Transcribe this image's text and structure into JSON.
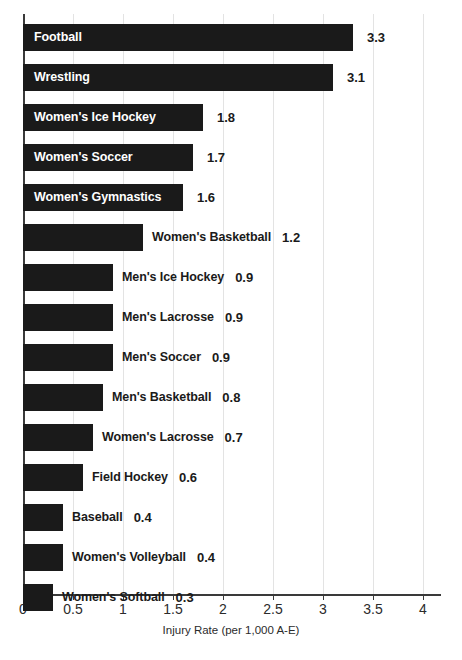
{
  "chart_data": {
    "type": "bar",
    "orientation": "horizontal",
    "title": "",
    "xlabel": "Injury Rate (per 1,000 A-E)",
    "ylabel": "",
    "xlim": [
      0,
      4.2
    ],
    "xticks": [
      "0",
      "0.5",
      "1",
      "1.5",
      "2",
      "2.5",
      "3",
      "3.5",
      "4"
    ],
    "xtick_values": [
      0,
      0.5,
      1,
      1.5,
      2,
      2.5,
      3,
      3.5,
      4
    ],
    "grid": true,
    "grid_axis": "x",
    "legend": "none",
    "bar_color": "#1a1a1a",
    "categories": [
      "Football",
      "Wrestling",
      "Women's Ice Hockey",
      "Women's Soccer",
      "Women's Gymnastics",
      "Women's Basketball",
      "Men's Ice Hockey",
      "Men's Lacrosse",
      "Men's Soccer",
      "Men's Basketball",
      "Women's Lacrosse",
      "Field Hockey",
      "Baseball",
      "Women's Volleyball",
      "Women's Softball"
    ],
    "values": [
      3.3,
      3.1,
      1.8,
      1.7,
      1.6,
      1.2,
      0.9,
      0.9,
      0.9,
      0.8,
      0.7,
      0.6,
      0.4,
      0.4,
      0.3
    ],
    "value_labels": [
      "3.3",
      "3.1",
      "1.8",
      "1.7",
      "1.6",
      "1.2",
      "0.9",
      "0.9",
      "0.9",
      "0.8",
      "0.7",
      "0.6",
      "0.4",
      "0.4",
      "0.3"
    ],
    "label_placement": [
      "inside",
      "inside",
      "inside",
      "inside",
      "inside",
      "outside",
      "outside",
      "outside",
      "outside",
      "outside",
      "outside",
      "outside",
      "outside",
      "outside",
      "outside"
    ]
  },
  "axis": {
    "x_title": "Injury Rate (per 1,000 A-E)"
  },
  "page": {
    "header_sliver": "",
    "caption_sliver": ""
  }
}
